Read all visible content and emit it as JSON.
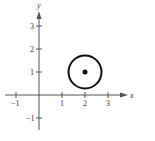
{
  "diagram": {
    "type": "coordinate-plane",
    "x_axis": {
      "label": "x",
      "ticks": [
        {
          "value": -1,
          "label": "−1"
        },
        {
          "value": 1,
          "label": "1"
        },
        {
          "value": 2,
          "label": "2"
        },
        {
          "value": 3,
          "label": "3"
        }
      ]
    },
    "y_axis": {
      "label": "y",
      "ticks": [
        {
          "value": -1,
          "label": "−1"
        },
        {
          "value": 1,
          "label": "1"
        },
        {
          "value": 2,
          "label": "2"
        },
        {
          "value": 3,
          "label": "3"
        }
      ]
    },
    "circle": {
      "center": [
        2,
        1
      ],
      "radius": 0.75
    },
    "center_point": [
      2,
      1
    ]
  }
}
